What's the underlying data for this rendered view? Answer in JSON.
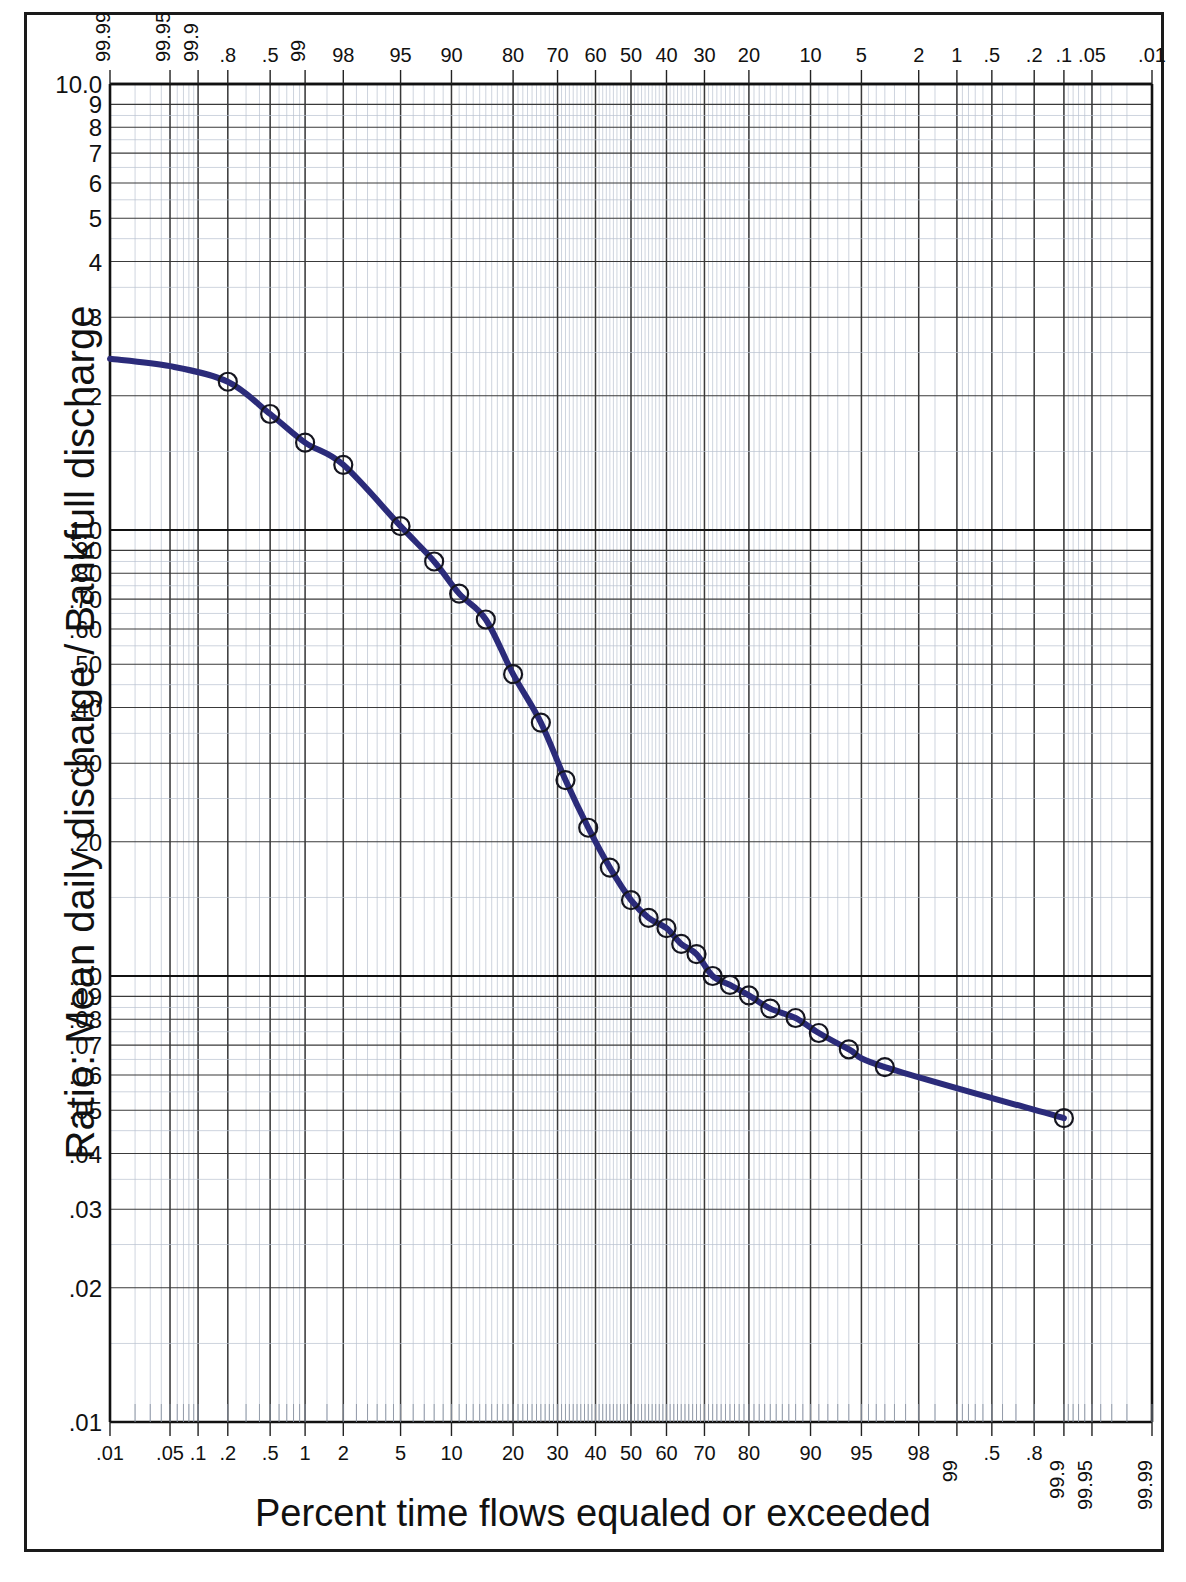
{
  "axes": {
    "y_title": "Ratio:  Mean daily discharge / Bankfull discharge",
    "x_title": "Percent time flows equaled or exceeded",
    "y_tick_labels": [
      "10.0",
      "9",
      "8",
      "7",
      "6",
      "5",
      "4",
      "3",
      "2",
      "1.0",
      ".90",
      ".80",
      ".70",
      ".60",
      ".50",
      ".40",
      ".30",
      ".20",
      ".10",
      ".09",
      ".08",
      ".07",
      ".06",
      ".05",
      ".04",
      ".03",
      ".02",
      ".01"
    ],
    "x_top_labels": [
      "99.99",
      "99.95",
      "99.9",
      ".8",
      ".5",
      "99",
      "98",
      "95",
      "90",
      "80",
      "70",
      "60",
      "50",
      "40",
      "30",
      "20",
      "10",
      "5",
      "2",
      "1",
      ".5",
      ".2",
      ".1",
      ".05",
      ".01"
    ],
    "x_bottom_labels": [
      ".01",
      ".05",
      ".1",
      ".2",
      ".5",
      "1",
      "2",
      "5",
      "10",
      "20",
      "30",
      "40",
      "50",
      "60",
      "70",
      "80",
      "90",
      "95",
      "98",
      "99",
      ".5",
      ".8",
      "99.9",
      "99.95",
      "99.99"
    ]
  },
  "colors": {
    "curve": "#2b2b7a",
    "frame": "#1a1a1a",
    "major_grid": "#3a3a3a",
    "minor_grid": "#b9c2d0",
    "heavy_grid": "#111111"
  },
  "chart_data": {
    "type": "line",
    "title": "",
    "subtitle": "",
    "xlabel": "Percent time flows equaled or exceeded",
    "ylabel": "Ratio:  Mean daily discharge / Bankfull discharge",
    "x_scale": "normal-probability",
    "y_scale": "log",
    "ylim": [
      0.01,
      10.0
    ],
    "xlim": [
      0.01,
      99.99
    ],
    "grid": true,
    "legend": null,
    "marker": "open-circle",
    "series": [
      {
        "name": "Flow duration curve",
        "x": [
          0.2,
          0.5,
          1,
          2,
          5,
          8,
          11,
          15,
          20,
          26,
          32,
          38,
          44,
          50,
          55,
          60,
          64,
          68,
          72,
          76,
          80,
          84,
          88,
          91,
          94,
          96.5,
          99.9
        ],
        "y": [
          2.15,
          1.82,
          1.57,
          1.4,
          1.02,
          0.85,
          0.72,
          0.63,
          0.475,
          0.37,
          0.275,
          0.215,
          0.175,
          0.148,
          0.135,
          0.128,
          0.118,
          0.112,
          0.1,
          0.0955,
          0.0905,
          0.0845,
          0.0805,
          0.0745,
          0.0685,
          0.0625,
          0.048
        ],
        "note": "Open circles are plotted observations; smooth navy line is the fitted duration curve"
      }
    ]
  }
}
